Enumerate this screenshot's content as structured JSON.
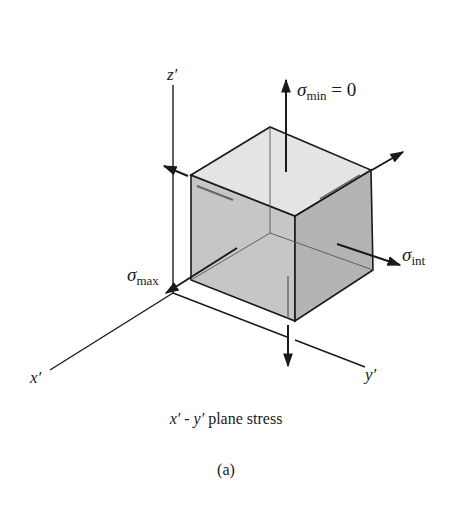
{
  "figure": {
    "caption": "x′ - y′ plane stress",
    "caption_parts": {
      "x": "x′",
      "sep": " - ",
      "y": "y′",
      "rest": " plane stress"
    },
    "subfigure_label": "(a)"
  },
  "axes": {
    "x": "x′",
    "y": "y′",
    "z": "z′"
  },
  "stresses": {
    "min": {
      "symbol": "σ",
      "subscript": "min",
      "suffix": " = 0"
    },
    "int": {
      "symbol": "σ",
      "subscript": "int"
    },
    "max": {
      "symbol": "σ",
      "subscript": "max"
    }
  },
  "colors": {
    "line": "#1a1a1a",
    "top_face": "#e4e4e4",
    "left_face": "#c6c6c6",
    "right_face": "#b4b4b4",
    "background": "#ffffff"
  }
}
